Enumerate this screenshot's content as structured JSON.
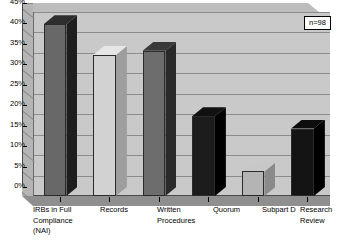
{
  "chart_data": {
    "type": "bar",
    "title": "",
    "subtitle": "",
    "xlabel": "",
    "ylabel": "",
    "ylim": [
      0,
      45
    ],
    "ytick_step": 5,
    "ytick_labels": [
      "0%",
      "5%",
      "10%",
      "15%",
      "20%",
      "25%",
      "30%",
      "35%",
      "40%",
      "45%"
    ],
    "grid": true,
    "legend_position": "top-right",
    "annotations": [
      "n=98"
    ],
    "categories": [
      "IRBs in Full\nCompliance\n(NAI)",
      "Records",
      "Written\nProcedures",
      "Quorum",
      "Subpart D",
      "Research\nReview"
    ],
    "values": [
      42,
      34.5,
      35.5,
      19.5,
      6,
      16.5
    ],
    "bar_colors": [
      "#686868",
      "#d2d2d2",
      "#6d6d6d",
      "#1c1c1c",
      "#b4b4b4",
      "#141414"
    ],
    "bar_side_colors": [
      "#1e1e1e",
      "#9e9e9e",
      "#2a2a2a",
      "#000000",
      "#8a8a8a",
      "#000000"
    ],
    "bar_top_colors": [
      "#2e2e2e",
      "#e6e6e6",
      "#3a3a3a",
      "#111111",
      "#c8c8c8",
      "#0d0d0d"
    ]
  },
  "legend": {
    "n_label": "n=98"
  },
  "colors": {
    "plot_background": "#c9c9c9",
    "wall_left": "#b5b5b5",
    "wall_top": "#bdbdbd",
    "floor": "#8f8f8f",
    "gridline": "#8c8c8c",
    "axis": "#000000",
    "page_background": "#ffffff"
  }
}
